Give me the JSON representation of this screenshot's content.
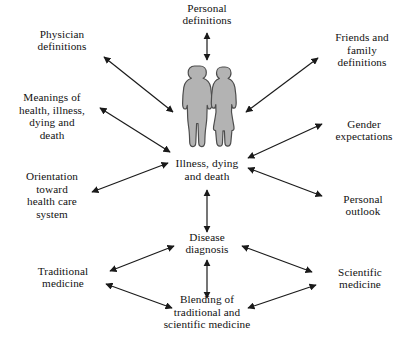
{
  "diagram": {
    "type": "radial-concept-map",
    "arrow_style": "double-headed",
    "background_color": "#ffffff",
    "line_color": "#1a1a1a",
    "text_color": "#111111",
    "figure_fill_color": "#b3b3b3",
    "figure_stroke_color": "#4d4d4d",
    "central_illustration": {
      "name": "two-person-silhouette",
      "description": "Man and woman standing side by side, gray silhouettes"
    },
    "nodes": [
      {
        "id": "personal-definitions",
        "label": "Personal\ndefinitions",
        "x": 207,
        "y": 14,
        "w": 110,
        "align": "center"
      },
      {
        "id": "physician-definitions",
        "label": "Physician\ndefinitions",
        "x": 62,
        "y": 40,
        "w": 108,
        "align": "center"
      },
      {
        "id": "friends-family-definitions",
        "label": "Friends and\nfamily\ndefinitions",
        "x": 362,
        "y": 50,
        "w": 100,
        "align": "center"
      },
      {
        "id": "meanings-of-health",
        "label": "Meanings of\nhealth, illness,\ndying and\ndeath",
        "x": 52,
        "y": 116,
        "w": 104,
        "align": "center"
      },
      {
        "id": "gender-expectations",
        "label": "Gender\nexpectations",
        "x": 364,
        "y": 130,
        "w": 96,
        "align": "center"
      },
      {
        "id": "illness-dying-death",
        "label": "Illness, dying\nand death",
        "x": 207,
        "y": 170,
        "w": 116,
        "align": "center"
      },
      {
        "id": "orientation-health-care",
        "label": "Orientation\ntoward\nhealth care\nsystem",
        "x": 52,
        "y": 195,
        "w": 102,
        "align": "center"
      },
      {
        "id": "personal-outlook",
        "label": "Personal\noutlook",
        "x": 363,
        "y": 205,
        "w": 94,
        "align": "center"
      },
      {
        "id": "disease-diagnosis",
        "label": "Disease\ndiagnosis",
        "x": 207,
        "y": 243,
        "w": 100,
        "align": "center"
      },
      {
        "id": "traditional-medicine",
        "label": "Traditional\nmedicine",
        "x": 63,
        "y": 277,
        "w": 104,
        "align": "center"
      },
      {
        "id": "scientific-medicine",
        "label": "Scientific\nmedicine",
        "x": 360,
        "y": 278,
        "w": 96,
        "align": "center"
      },
      {
        "id": "blending-medicine",
        "label": "Blending of\ntraditional and\nscientific medicine",
        "x": 207,
        "y": 312,
        "w": 140,
        "align": "center"
      }
    ],
    "connections": [
      {
        "id": "conn-personal-definitions",
        "from": "personal-definitions",
        "to": "illustration",
        "x1": 207,
        "y1": 33,
        "x2": 207,
        "y2": 60,
        "arrows": "both"
      },
      {
        "id": "conn-physician-definitions",
        "from": "physician-definitions",
        "to": "illness-dying-death",
        "x1": 104,
        "y1": 57,
        "x2": 173,
        "y2": 112,
        "arrows": "both"
      },
      {
        "id": "conn-friends-family",
        "from": "illness-dying-death",
        "to": "friends-family-definitions",
        "x1": 246,
        "y1": 112,
        "x2": 318,
        "y2": 58,
        "arrows": "both"
      },
      {
        "id": "conn-meanings-health",
        "from": "meanings-of-health",
        "to": "illness-dying-death",
        "x1": 100,
        "y1": 108,
        "x2": 170,
        "y2": 152,
        "arrows": "both"
      },
      {
        "id": "conn-gender-expectations",
        "from": "illness-dying-death",
        "to": "gender-expectations",
        "x1": 248,
        "y1": 158,
        "x2": 322,
        "y2": 124,
        "arrows": "both"
      },
      {
        "id": "conn-orientation-health",
        "from": "orientation-health-care",
        "to": "illness-dying-death",
        "x1": 92,
        "y1": 192,
        "x2": 168,
        "y2": 163,
        "arrows": "both"
      },
      {
        "id": "conn-personal-outlook",
        "from": "illness-dying-death",
        "to": "personal-outlook",
        "x1": 248,
        "y1": 168,
        "x2": 322,
        "y2": 196,
        "arrows": "both"
      },
      {
        "id": "conn-illness-diagnosis",
        "from": "illness-dying-death",
        "to": "disease-diagnosis",
        "x1": 207,
        "y1": 190,
        "x2": 207,
        "y2": 232,
        "arrows": "both"
      },
      {
        "id": "conn-diagnosis-traditional",
        "from": "disease-diagnosis",
        "to": "traditional-medicine",
        "x1": 174,
        "y1": 246,
        "x2": 110,
        "y2": 271,
        "arrows": "both"
      },
      {
        "id": "conn-diagnosis-scientific",
        "from": "disease-diagnosis",
        "to": "scientific-medicine",
        "x1": 242,
        "y1": 246,
        "x2": 312,
        "y2": 272,
        "arrows": "both"
      },
      {
        "id": "conn-diagnosis-blending",
        "from": "disease-diagnosis",
        "to": "blending-medicine",
        "x1": 207,
        "y1": 260,
        "x2": 207,
        "y2": 298,
        "arrows": "both"
      },
      {
        "id": "conn-traditional-blending",
        "from": "traditional-medicine",
        "to": "blending-medicine",
        "x1": 106,
        "y1": 284,
        "x2": 172,
        "y2": 308,
        "arrows": "both"
      },
      {
        "id": "conn-scientific-blending",
        "from": "scientific-medicine",
        "to": "blending-medicine",
        "x1": 316,
        "y1": 285,
        "x2": 248,
        "y2": 308,
        "arrows": "both"
      }
    ]
  }
}
